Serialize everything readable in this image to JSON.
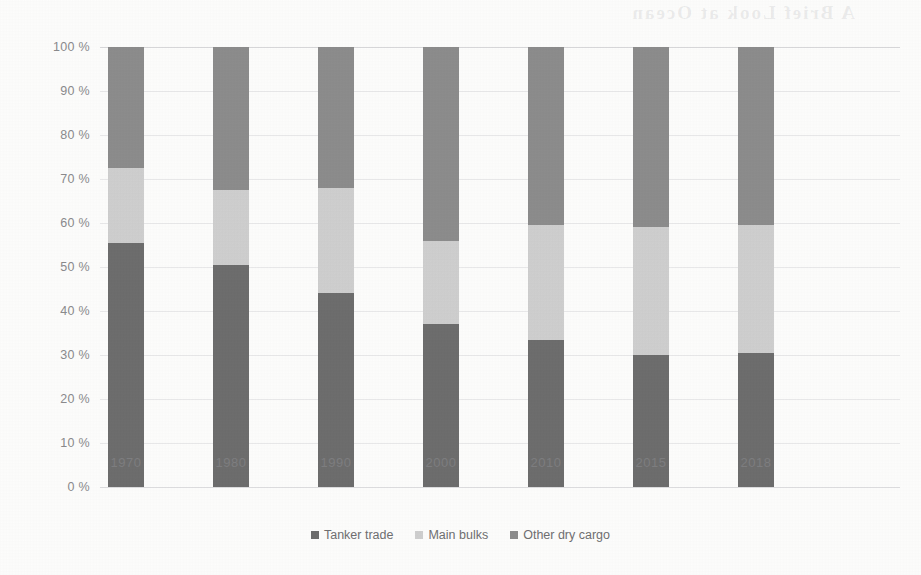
{
  "figure": {
    "background_color": "#fdfdfc",
    "bleed_through_text": "A Brief Look at Ocean"
  },
  "chart_data": {
    "type": "bar",
    "stacked": true,
    "normalized_percent": true,
    "title": "",
    "subtitle": "",
    "xlabel": "",
    "ylabel": "",
    "categories": [
      "1970",
      "1980",
      "1990",
      "2000",
      "2010",
      "2015",
      "2018"
    ],
    "ytick_labels": [
      "0 %",
      "10 %",
      "20 %",
      "30 %",
      "40 %",
      "50 %",
      "60 %",
      "70 %",
      "80 %",
      "90 %",
      "100 %"
    ],
    "ytick_values": [
      0,
      10,
      20,
      30,
      40,
      50,
      60,
      70,
      80,
      90,
      100
    ],
    "ylim": [
      0,
      100
    ],
    "grid": true,
    "legend_position": "bottom",
    "series": [
      {
        "name": "Tanker trade",
        "color": "#6d6d6d",
        "values": [
          55.5,
          50.5,
          44.0,
          37.0,
          33.5,
          30.0,
          30.5
        ]
      },
      {
        "name": "Main bulks",
        "color": "#cfcfcf",
        "values": [
          17.0,
          17.0,
          24.0,
          19.0,
          26.0,
          29.0,
          29.0
        ]
      },
      {
        "name": "Other dry cargo",
        "color": "#8c8c8c",
        "values": [
          27.5,
          32.5,
          32.0,
          44.0,
          40.5,
          41.0,
          40.5
        ]
      }
    ]
  }
}
